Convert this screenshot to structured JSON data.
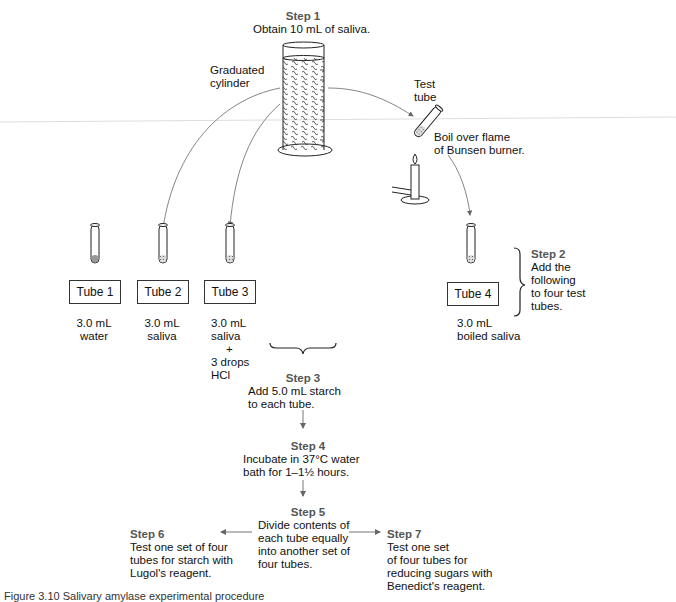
{
  "step1": {
    "label": "Step 1",
    "text": "Obtain 10 mL of saliva."
  },
  "labels": {
    "graduated_cylinder": [
      "Graduated",
      "cylinder"
    ],
    "test_tube": [
      "Test",
      "tube"
    ],
    "boil": [
      "Boil over flame",
      "of Bunsen burner."
    ]
  },
  "tubes": [
    {
      "name": "Tube 1",
      "contents": [
        "3.0 mL",
        "water"
      ]
    },
    {
      "name": "Tube 2",
      "contents": [
        "3.0 mL",
        "saliva"
      ]
    },
    {
      "name": "Tube 3",
      "contents": [
        "3.0 mL",
        "saliva",
        "+",
        "3 drops",
        "HCl"
      ]
    },
    {
      "name": "Tube 4",
      "contents": [
        "3.0 mL",
        "boiled saliva"
      ]
    }
  ],
  "step2": {
    "label": "Step 2",
    "lines": [
      "Add the",
      "following",
      "to four test",
      "tubes."
    ]
  },
  "step3": {
    "label": "Step 3",
    "lines": [
      "Add 5.0 mL starch",
      "to each tube."
    ]
  },
  "step4": {
    "label": "Step 4",
    "lines": [
      "Incubate in 37°C water",
      "bath for 1–1½ hours."
    ]
  },
  "step5": {
    "label": "Step 5",
    "lines": [
      "Divide contents of",
      "each tube equally",
      "into another set of",
      "four tubes."
    ]
  },
  "step6": {
    "label": "Step 6",
    "lines": [
      "Test one set of four",
      "tubes for starch with",
      "Lugol's reagent."
    ]
  },
  "step7": {
    "label": "Step 7",
    "lines": [
      "Test one set",
      "of four tubes for",
      "reducing sugars with",
      "Benedict's reagent."
    ]
  },
  "caption": "Figure 3.10 Salivary amylase experimental procedure"
}
